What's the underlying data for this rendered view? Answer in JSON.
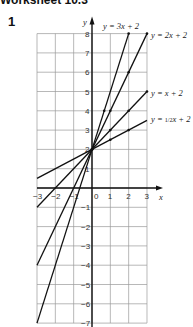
{
  "page": {
    "heading": "Worksheet 10.3",
    "question_number": "1"
  },
  "chart_data": {
    "type": "line",
    "title": "",
    "xlabel": "x",
    "ylabel": "y",
    "xlim": [
      -3,
      3
    ],
    "ylim": [
      -7,
      8
    ],
    "grid": true,
    "x_ticks": [
      -3,
      -2,
      -1,
      0,
      1,
      2,
      3
    ],
    "y_ticks": [
      -7,
      -6,
      -5,
      -4,
      -3,
      -2,
      -1,
      1,
      2,
      3,
      4,
      5,
      6,
      7,
      8
    ],
    "series": [
      {
        "name": "y = 3x + 2",
        "slope": 3,
        "intercept": 2,
        "x": [
          -3,
          2
        ],
        "y": [
          -7,
          8
        ],
        "points": [
          [
            0,
            2
          ],
          [
            0.667,
            4
          ],
          [
            2,
            8
          ]
        ]
      },
      {
        "name": "y = 2x + 2",
        "slope": 2,
        "intercept": 2,
        "x": [
          -3,
          3
        ],
        "y": [
          -4,
          8
        ],
        "points": [
          [
            0,
            2
          ],
          [
            1,
            4
          ],
          [
            2,
            6
          ],
          [
            3,
            8
          ]
        ]
      },
      {
        "name": "y = x + 2",
        "slope": 1,
        "intercept": 2,
        "x": [
          -3,
          3
        ],
        "y": [
          -1,
          5
        ],
        "points": [
          [
            0,
            2
          ],
          [
            1,
            3
          ],
          [
            2,
            4
          ],
          [
            3,
            5
          ]
        ]
      },
      {
        "name": "y = ½x + 2",
        "slope": 0.5,
        "intercept": 2,
        "x": [
          -3,
          3
        ],
        "y": [
          0.5,
          3.5
        ],
        "points": [
          [
            0,
            2
          ],
          [
            1,
            2.5
          ],
          [
            2,
            3
          ]
        ]
      }
    ],
    "labels": {
      "s1": "y = 3x + 2",
      "s2": "y = 2x + 2",
      "s3": "y = x + 2",
      "s4_prefix": "y = ",
      "s4_frac": "1/2",
      "s4_suffix": "x + 2"
    }
  }
}
